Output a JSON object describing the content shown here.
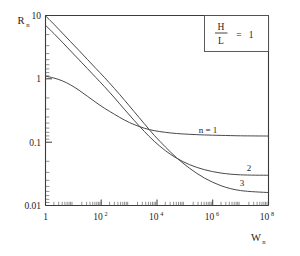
{
  "chart_data": {
    "type": "line",
    "title": "",
    "subtitle": "",
    "xlabel": "W",
    "xlabel_sub": "n",
    "ylabel": "R",
    "ylabel_sub": "n",
    "xscale": "log",
    "yscale": "log",
    "xlim": [
      1,
      100000000
    ],
    "ylim": [
      0.01,
      10
    ],
    "grid": false,
    "legend_position": "inline-right",
    "x_ticks": [
      {
        "value": 1,
        "mantissa": "1",
        "exponent": ""
      },
      {
        "value": 100,
        "mantissa": "10",
        "exponent": "2"
      },
      {
        "value": 10000,
        "mantissa": "10",
        "exponent": "4"
      },
      {
        "value": 1000000,
        "mantissa": "10",
        "exponent": "6"
      },
      {
        "value": 100000000,
        "mantissa": "10",
        "exponent": "8"
      }
    ],
    "y_ticks": [
      {
        "value": 10,
        "label": "10"
      },
      {
        "value": 1,
        "label": "1"
      },
      {
        "value": 0.1,
        "label": "0.1"
      },
      {
        "value": 0.01,
        "label": "0.01"
      }
    ],
    "annotation": {
      "numerator": "H",
      "denominator": "L",
      "equals": "=",
      "value": "1"
    },
    "series": [
      {
        "name": "n = 1",
        "label": "n = 1",
        "label_x": 3000000,
        "label_y": 0.22,
        "points": [
          [
            1,
            1.1
          ],
          [
            2,
            1.03
          ],
          [
            4,
            0.93
          ],
          [
            8,
            0.8
          ],
          [
            16,
            0.66
          ],
          [
            32,
            0.53
          ],
          [
            64,
            0.425
          ],
          [
            128,
            0.345
          ],
          [
            300,
            0.275
          ],
          [
            700,
            0.222
          ],
          [
            1500,
            0.19
          ],
          [
            3500,
            0.166
          ],
          [
            8000,
            0.152
          ],
          [
            20000,
            0.143
          ],
          [
            50000,
            0.137
          ],
          [
            150000,
            0.133
          ],
          [
            500000,
            0.13
          ],
          [
            2000000,
            0.128
          ],
          [
            10000000,
            0.126
          ],
          [
            100000000,
            0.125
          ]
        ]
      },
      {
        "name": "2",
        "label": "2",
        "label_x": 26000000,
        "label_y": 0.044,
        "points": [
          [
            1,
            7.0
          ],
          [
            2,
            5.2
          ],
          [
            4,
            3.8
          ],
          [
            8,
            2.75
          ],
          [
            16,
            2.0
          ],
          [
            32,
            1.45
          ],
          [
            64,
            1.05
          ],
          [
            128,
            0.76
          ],
          [
            300,
            0.5
          ],
          [
            700,
            0.325
          ],
          [
            1500,
            0.222
          ],
          [
            3500,
            0.148
          ],
          [
            8000,
            0.103
          ],
          [
            20000,
            0.0735
          ],
          [
            50000,
            0.056
          ],
          [
            150000,
            0.044
          ],
          [
            500000,
            0.0368
          ],
          [
            2000000,
            0.0325
          ],
          [
            10000000,
            0.0305
          ],
          [
            100000000,
            0.03
          ]
        ]
      },
      {
        "name": "3",
        "label": "3",
        "label_x": 21000000,
        "label_y": 0.0215,
        "points": [
          [
            1,
            9.9
          ],
          [
            2,
            7.3
          ],
          [
            4,
            5.3
          ],
          [
            8,
            3.85
          ],
          [
            16,
            2.8
          ],
          [
            32,
            2.02
          ],
          [
            64,
            1.46
          ],
          [
            128,
            1.06
          ],
          [
            300,
            0.7
          ],
          [
            700,
            0.455
          ],
          [
            1500,
            0.305
          ],
          [
            3500,
            0.196
          ],
          [
            8000,
            0.128
          ],
          [
            20000,
            0.084
          ],
          [
            50000,
            0.057
          ],
          [
            150000,
            0.0385
          ],
          [
            500000,
            0.0272
          ],
          [
            2000000,
            0.0205
          ],
          [
            10000000,
            0.0172
          ],
          [
            100000000,
            0.016
          ]
        ]
      }
    ]
  }
}
